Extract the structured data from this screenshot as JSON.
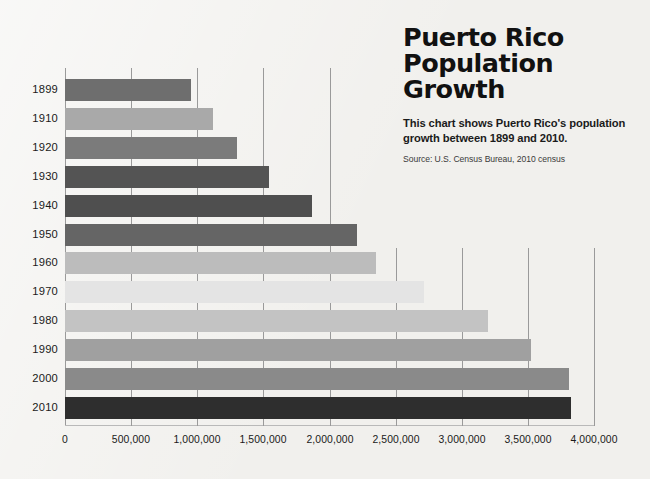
{
  "title": "Puerto Rico\nPopulation\nGrowth",
  "subtitle": "This chart shows Puerto Rico's population growth between 1899 and 2010.",
  "source": "Source: U.S. Census Bureau, 2010 census",
  "background_color": "#f1f0ed",
  "gridline_color": "#9a9a9a",
  "chart_data": {
    "type": "bar",
    "orientation": "horizontal",
    "title": "Puerto Rico Population Growth",
    "subtitle": "This chart shows Puerto Rico's population growth between 1899 and 2010.",
    "source": "Source: U.S. Census Bureau, 2010 census",
    "xlabel": "",
    "ylabel": "",
    "xlim": [
      0,
      4000000
    ],
    "grid": true,
    "legend": "none",
    "xticks": [
      0,
      500000,
      1000000,
      1500000,
      2000000,
      2500000,
      3000000,
      3500000,
      4000000
    ],
    "xtick_labels": [
      "0",
      "500,000",
      "1,000,000",
      "1,500,000",
      "2,000,000",
      "2,500,000",
      "3,000,000",
      "3,500,000",
      "4,000,000"
    ],
    "categories": [
      "1899",
      "1910",
      "1920",
      "1930",
      "1940",
      "1950",
      "1960",
      "1970",
      "1980",
      "1990",
      "2000",
      "2010"
    ],
    "values": [
      953243,
      1118012,
      1299809,
      1543913,
      1869255,
      2210703,
      2349544,
      2712033,
      3196520,
      3522037,
      3808610,
      3825789
    ],
    "bar_colors": [
      "#6e6e6e",
      "#a9a9a9",
      "#7b7b7b",
      "#545454",
      "#4f4f4f",
      "#656565",
      "#bcbcbc",
      "#e4e4e4",
      "#c3c3c3",
      "#a0a0a0",
      "#8a8a8a",
      "#2e2e2e"
    ]
  }
}
